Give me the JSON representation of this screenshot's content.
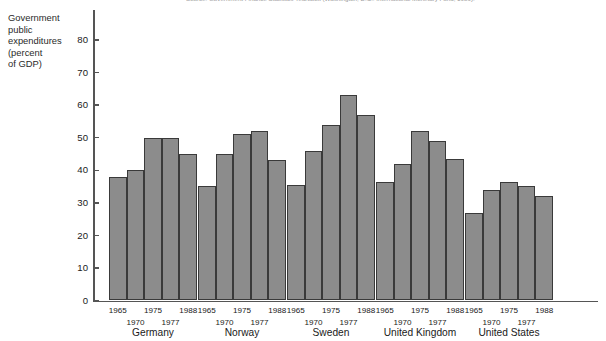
{
  "source_note": "Source: Government Finance Statistics Yearbook (Washington, D.C.: International Monetary Fund, 1989).",
  "y_axis_caption": [
    "Government",
    "public",
    "expenditures",
    "(percent",
    "of GDP)"
  ],
  "colors": {
    "bar_fill": "#8c8c8c",
    "bar_stroke": "#3a3a3a",
    "axis": "#555555",
    "text": "#1a1a1a",
    "background": "#ffffff"
  },
  "chart_data": {
    "type": "bar",
    "title": "",
    "subtitle": "",
    "xlabel": "",
    "ylabel": "Government public expenditures (percent of GDP)",
    "ylim": [
      0,
      85
    ],
    "yticks": [
      0,
      10,
      20,
      30,
      40,
      50,
      60,
      70,
      80
    ],
    "ytick_labels": [
      "0",
      "10",
      "20",
      "30",
      "40",
      "50",
      "60",
      "70",
      "80"
    ],
    "grid": false,
    "legend": "none",
    "categories": [
      "Germany",
      "Norway",
      "Sweden",
      "United Kingdom",
      "United States"
    ],
    "x": [
      "1965",
      "1970",
      "1975",
      "1977",
      "1988"
    ],
    "series": [
      {
        "name": "1965",
        "values": [
          38,
          35,
          35.5,
          36.5,
          27
        ]
      },
      {
        "name": "1970",
        "values": [
          40,
          45,
          46,
          42,
          34
        ]
      },
      {
        "name": "1975",
        "values": [
          50,
          51,
          54,
          52,
          36.5
        ]
      },
      {
        "name": "1977",
        "values": [
          50,
          52,
          63,
          49,
          35
        ]
      },
      {
        "name": "1988",
        "values": [
          45,
          43,
          57,
          43.5,
          32
        ]
      }
    ],
    "groups": [
      {
        "label": "Germany",
        "years": [
          "1965",
          "1970",
          "1975",
          "1977",
          "1988"
        ],
        "values": [
          38,
          40,
          50,
          50,
          45
        ]
      },
      {
        "label": "Norway",
        "years": [
          "1965",
          "1970",
          "1975",
          "1977",
          "1988"
        ],
        "values": [
          35,
          45,
          51,
          52,
          43
        ]
      },
      {
        "label": "Sweden",
        "years": [
          "1965",
          "1970",
          "1975",
          "1977",
          "1988"
        ],
        "values": [
          35.5,
          46,
          54,
          63,
          57
        ]
      },
      {
        "label": "United Kingdom",
        "years": [
          "1965",
          "1970",
          "1975",
          "1977",
          "1988"
        ],
        "values": [
          36.5,
          42,
          52,
          49,
          43.5
        ]
      },
      {
        "label": "United States",
        "years": [
          "1965",
          "1970",
          "1975",
          "1977",
          "1988"
        ],
        "values": [
          27,
          34,
          36.5,
          35,
          32
        ]
      }
    ]
  }
}
